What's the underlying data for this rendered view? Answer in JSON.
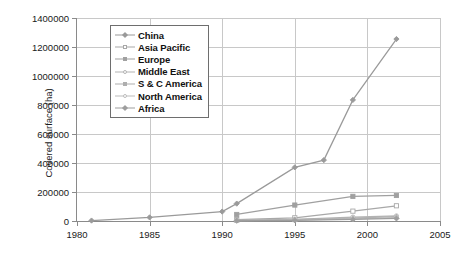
{
  "chart_data": {
    "type": "line",
    "title": "",
    "xlabel": "",
    "ylabel": "Covered surface (ha)",
    "xlim": [
      1980,
      2005
    ],
    "ylim": [
      0,
      1400000
    ],
    "xticks": [
      1980,
      1985,
      1990,
      1995,
      2000,
      2005
    ],
    "yticks": [
      0,
      200000,
      400000,
      600000,
      800000,
      1000000,
      1200000,
      1400000
    ],
    "xtick_labels": [
      "1980",
      "1985",
      "1990",
      "1995",
      "2000",
      "2005"
    ],
    "ytick_labels": [
      "0",
      "200000",
      "400000",
      "600000",
      "800000",
      "1000000",
      "1200000",
      "1400000"
    ],
    "grid": true,
    "legend_position": "upper left inside plot",
    "series": [
      {
        "name": "China",
        "color": "#9a9a9a",
        "marker": "filled-diamond",
        "x": [
          1981,
          1985,
          1990,
          1991,
          1995,
          1997,
          1999,
          2002
        ],
        "values": [
          3000,
          25000,
          65000,
          120000,
          370000,
          420000,
          835000,
          1255000
        ]
      },
      {
        "name": "Asia Pacific",
        "color": "#a8a8a8",
        "marker": "open-square",
        "x": [
          1991,
          1995,
          1999,
          2002
        ],
        "values": [
          10000,
          22000,
          68000,
          105000
        ]
      },
      {
        "name": "Europe",
        "color": "#a0a0a0",
        "marker": "filled-square",
        "x": [
          1991,
          1995,
          1999,
          2002
        ],
        "values": [
          45000,
          110000,
          170000,
          176000
        ]
      },
      {
        "name": "Middle East",
        "color": "#b4b4b4",
        "marker": "open-circle",
        "x": [
          1991,
          1995,
          1999,
          2002
        ],
        "values": [
          5000,
          12000,
          27000,
          35000
        ]
      },
      {
        "name": "S & C America",
        "color": "#aeaeae",
        "marker": "filled-triangle",
        "x": [
          1991,
          1995,
          1999,
          2002
        ],
        "values": [
          4000,
          9000,
          20000,
          30000
        ]
      },
      {
        "name": "North America",
        "color": "#bcbcbc",
        "marker": "open-circle",
        "x": [
          1991,
          1995,
          1999,
          2002
        ],
        "values": [
          3000,
          7000,
          15000,
          24000
        ]
      },
      {
        "name": "Africa",
        "color": "#9e9e9e",
        "marker": "filled-diamond",
        "x": [
          1991,
          1995,
          1999,
          2002
        ],
        "values": [
          2000,
          5000,
          11000,
          18000
        ]
      }
    ]
  },
  "axis": {
    "y_title": "Covered surface (ha)"
  }
}
